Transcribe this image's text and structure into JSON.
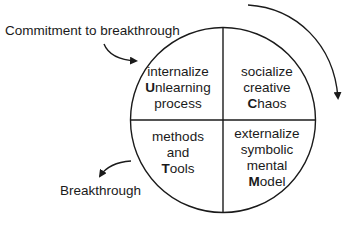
{
  "diagram": {
    "entry_label": "Commitment to breakthrough",
    "exit_label": "Breakthrough",
    "quadrants": {
      "top_left": {
        "lines": [
          "internalize"
        ],
        "key_letter": "U",
        "key_rest": "nlearning",
        "last": "process"
      },
      "top_right": {
        "lines": [
          "socialize",
          "creative"
        ],
        "key_letter": "C",
        "key_rest": "haos"
      },
      "bottom_left": {
        "lines": [
          "methods",
          "and"
        ],
        "key_letter": "T",
        "key_rest": "ools"
      },
      "bottom_right": {
        "lines": [
          "externalize",
          "symbolic",
          "mental"
        ],
        "key_letter": "M",
        "key_rest": "odel"
      }
    },
    "cycle_direction": "clockwise",
    "colors": {
      "stroke": "#1a1a1a",
      "background": "#ffffff"
    }
  }
}
